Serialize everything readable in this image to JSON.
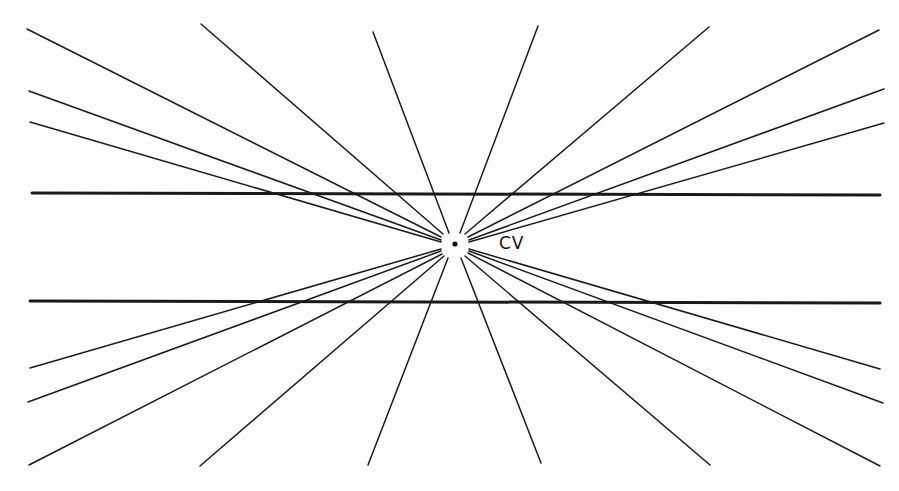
{
  "diagram": {
    "title": "",
    "center_label": "CV",
    "center": {
      "x": 455,
      "y": 244
    },
    "line_color": "#1a1a1a",
    "background": "#ffffff",
    "horizontal_lines": [
      {
        "x1": 32,
        "y1": 193,
        "x2": 880,
        "y2": 195
      },
      {
        "x1": 30,
        "y1": 301,
        "x2": 880,
        "y2": 303
      }
    ],
    "radial_lines": [
      {
        "x1": 27,
        "y1": 29,
        "x2": 441,
        "y2": 237
      },
      {
        "x1": 29,
        "y1": 91,
        "x2": 441,
        "y2": 240
      },
      {
        "x1": 30,
        "y1": 122,
        "x2": 441,
        "y2": 242
      },
      {
        "x1": 201,
        "y1": 24,
        "x2": 443,
        "y2": 234
      },
      {
        "x1": 373,
        "y1": 32,
        "x2": 449,
        "y2": 233
      },
      {
        "x1": 538,
        "y1": 26,
        "x2": 460,
        "y2": 233
      },
      {
        "x1": 709,
        "y1": 27,
        "x2": 465,
        "y2": 234
      },
      {
        "x1": 879,
        "y1": 30,
        "x2": 468,
        "y2": 237
      },
      {
        "x1": 884,
        "y1": 89,
        "x2": 469,
        "y2": 240
      },
      {
        "x1": 884,
        "y1": 123,
        "x2": 469,
        "y2": 242
      },
      {
        "x1": 30,
        "y1": 368,
        "x2": 441,
        "y2": 249
      },
      {
        "x1": 28,
        "y1": 402,
        "x2": 441,
        "y2": 251
      },
      {
        "x1": 29,
        "y1": 465,
        "x2": 442,
        "y2": 254
      },
      {
        "x1": 200,
        "y1": 466,
        "x2": 444,
        "y2": 256
      },
      {
        "x1": 368,
        "y1": 465,
        "x2": 448,
        "y2": 258
      },
      {
        "x1": 541,
        "y1": 463,
        "x2": 461,
        "y2": 258
      },
      {
        "x1": 710,
        "y1": 465,
        "x2": 465,
        "y2": 256
      },
      {
        "x1": 880,
        "y1": 466,
        "x2": 468,
        "y2": 253
      },
      {
        "x1": 883,
        "y1": 403,
        "x2": 469,
        "y2": 251
      },
      {
        "x1": 880,
        "y1": 369,
        "x2": 469,
        "y2": 249
      }
    ]
  }
}
